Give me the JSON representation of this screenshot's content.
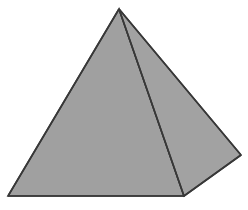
{
  "figure": {
    "name": "square-pyramid",
    "title": "Square pyramid (three-dimensional solid)",
    "canvas": {
      "width": 248,
      "height": 210,
      "background_color": "#ffffff"
    },
    "style": {
      "face_fill": "#a0a0a0",
      "face_fill_right": "#a2a2a2",
      "edge_color": "#383838",
      "edge_width": 1.6
    },
    "vertices": {
      "apex": {
        "label": "apex",
        "x": 119,
        "y": 9
      },
      "base_left": {
        "label": "base-left",
        "x": 8,
        "y": 196
      },
      "base_front": {
        "label": "base-front",
        "x": 184,
        "y": 196
      },
      "base_right": {
        "label": "base-right",
        "x": 241,
        "y": 155
      }
    },
    "faces": [
      {
        "name": "left-lateral-face",
        "points": "119,9 8,196 184,196",
        "fill": "#a0a0a0"
      },
      {
        "name": "right-lateral-face",
        "points": "119,9 184,196 241,155",
        "fill": "#a2a2a2"
      }
    ],
    "edges": [
      {
        "name": "apex-to-base-left-edge",
        "x1": 119,
        "y1": 9,
        "x2": 8,
        "y2": 196
      },
      {
        "name": "apex-to-base-right-edge",
        "x1": 119,
        "y1": 9,
        "x2": 241,
        "y2": 155
      },
      {
        "name": "apex-to-base-front-edge",
        "x1": 119,
        "y1": 9,
        "x2": 184,
        "y2": 196
      },
      {
        "name": "base-front-bottom-edge",
        "x1": 8,
        "y1": 196,
        "x2": 184,
        "y2": 196
      },
      {
        "name": "base-right-lower-edge",
        "x1": 184,
        "y1": 196,
        "x2": 241,
        "y2": 155
      }
    ]
  }
}
